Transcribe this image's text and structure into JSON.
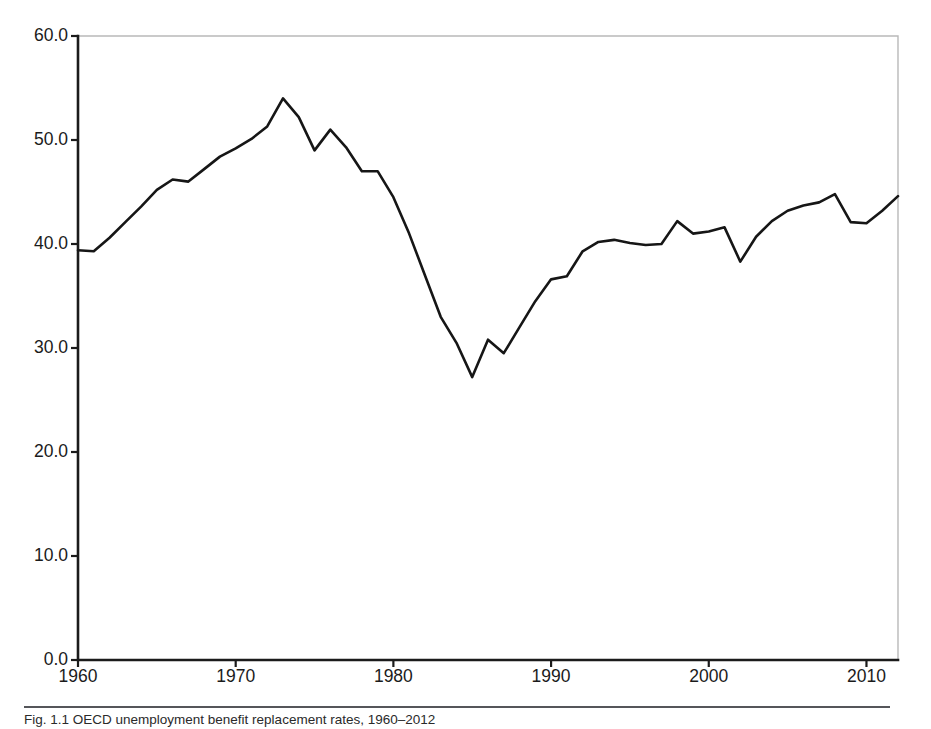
{
  "figure": {
    "caption": "Fig. 1.1 OECD unemployment benefit replacement rates, 1960–2012",
    "background_color": "#ffffff",
    "line_color": "#161616",
    "axis_color": "#1b1b1b",
    "frame_color": "#b9b9b9"
  },
  "chart_data": {
    "type": "line",
    "title": "",
    "xlabel": "",
    "ylabel": "",
    "xlim": [
      1960,
      2012
    ],
    "ylim": [
      0.0,
      60.0
    ],
    "grid": false,
    "legend": null,
    "xticks": [
      "1960",
      "1970",
      "1980",
      "1990",
      "2000",
      "2010"
    ],
    "xtick_values": [
      1960,
      1970,
      1980,
      1990,
      2000,
      2010
    ],
    "yticks": [
      "0.0",
      "10.0",
      "20.0",
      "30.0",
      "40.0",
      "50.0",
      "60.0"
    ],
    "ytick_values": [
      0.0,
      10.0,
      20.0,
      30.0,
      40.0,
      50.0,
      60.0
    ],
    "series": [
      {
        "name": "replacement rate",
        "x": [
          1960,
          1961,
          1962,
          1963,
          1964,
          1965,
          1966,
          1967,
          1968,
          1969,
          1970,
          1971,
          1972,
          1973,
          1974,
          1975,
          1976,
          1977,
          1978,
          1979,
          1980,
          1981,
          1982,
          1983,
          1984,
          1985,
          1986,
          1987,
          1988,
          1989,
          1990,
          1991,
          1992,
          1993,
          1994,
          1995,
          1996,
          1997,
          1998,
          1999,
          2000,
          2001,
          2002,
          2003,
          2004,
          2005,
          2006,
          2007,
          2008,
          2009,
          2010,
          2011,
          2012
        ],
        "values": [
          39.4,
          39.3,
          40.6,
          42.1,
          43.6,
          45.2,
          46.2,
          46.0,
          47.2,
          48.4,
          49.2,
          50.1,
          51.3,
          54.0,
          52.2,
          49.0,
          51.0,
          49.3,
          47.0,
          47.0,
          44.5,
          41.0,
          37.0,
          33.0,
          30.5,
          27.2,
          30.8,
          29.5,
          32.0,
          34.5,
          36.6,
          36.9,
          39.3,
          40.2,
          40.4,
          40.1,
          39.9,
          40.0,
          42.2,
          41.0,
          41.2,
          41.6,
          38.3,
          40.7,
          42.2,
          43.2,
          43.7,
          44.0,
          44.8,
          42.1,
          42.0,
          43.2,
          44.6
        ]
      }
    ]
  }
}
